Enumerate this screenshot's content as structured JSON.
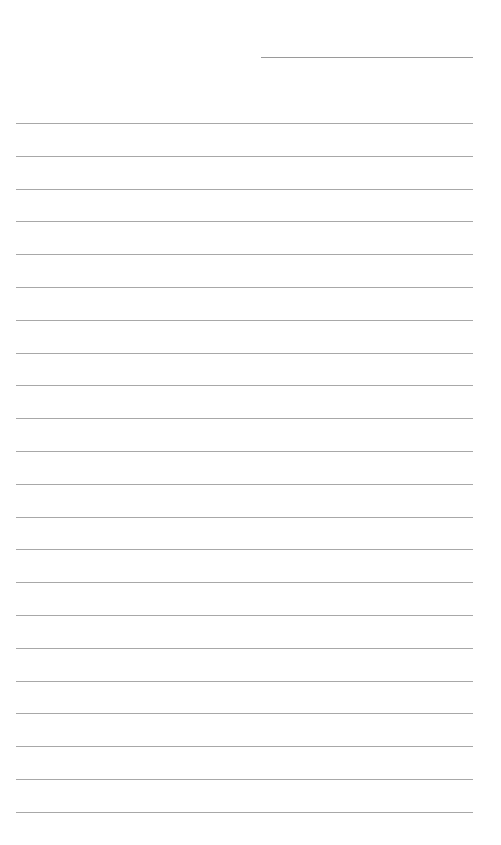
{
  "page": {
    "type": "lined-paper",
    "background": "#ffffff",
    "line_color": "#a8a8a8"
  },
  "header_line": {
    "x_start": 261,
    "x_end": 473,
    "y": 57,
    "color": "#9a9a9a"
  },
  "ruled_lines": {
    "count": 22,
    "x_start": 16,
    "x_end": 473,
    "first_y": 123,
    "spacing": 32.8,
    "color": "#a8a8a8"
  }
}
